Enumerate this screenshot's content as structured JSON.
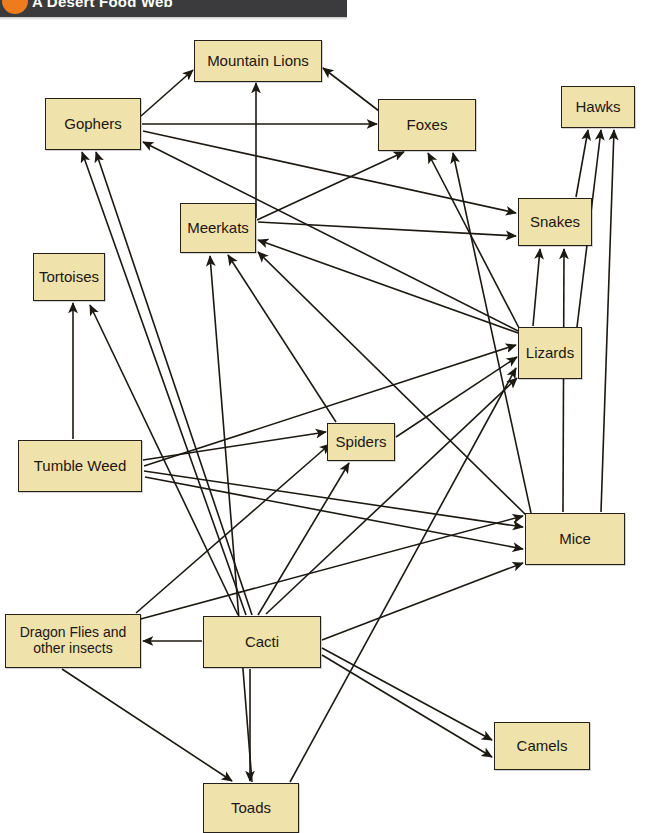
{
  "banner": {
    "title": "A Desert Food Web",
    "dot_icon": "orange-circle-icon",
    "bar_color": "#3b3b3d",
    "accent_color": "#ef7b1f"
  },
  "diagram": {
    "type": "food-web",
    "node_fill": "#f0e2ab",
    "node_border": "#26201a",
    "edge_color": "#1c1812",
    "nodes": [
      {
        "id": "mountain_lions",
        "label": "Mountain Lions",
        "x": 194,
        "y": 40,
        "w": 128,
        "h": 42,
        "trophic": "tertiary-consumer"
      },
      {
        "id": "gophers",
        "label": "Gophers",
        "x": 45,
        "y": 98,
        "w": 96,
        "h": 52,
        "trophic": "primary-consumer"
      },
      {
        "id": "foxes",
        "label": "Foxes",
        "x": 378,
        "y": 99,
        "w": 98,
        "h": 52,
        "trophic": "secondary-consumer"
      },
      {
        "id": "hawks",
        "label": "Hawks",
        "x": 561,
        "y": 86,
        "w": 74,
        "h": 42,
        "trophic": "tertiary-consumer"
      },
      {
        "id": "snakes",
        "label": "Snakes",
        "x": 518,
        "y": 198,
        "w": 74,
        "h": 48,
        "trophic": "secondary-consumer"
      },
      {
        "id": "meerkats",
        "label": "Meerkats",
        "x": 180,
        "y": 203,
        "w": 76,
        "h": 50,
        "trophic": "secondary-consumer"
      },
      {
        "id": "tortoises",
        "label": "Tortoises",
        "x": 33,
        "y": 253,
        "w": 72,
        "h": 48,
        "trophic": "primary-consumer"
      },
      {
        "id": "lizards",
        "label": "Lizards",
        "x": 518,
        "y": 327,
        "w": 64,
        "h": 52,
        "trophic": "secondary-consumer"
      },
      {
        "id": "spiders",
        "label": "Spiders",
        "x": 327,
        "y": 423,
        "w": 68,
        "h": 38,
        "trophic": "secondary-consumer"
      },
      {
        "id": "tumble_weed",
        "label": "Tumble Weed",
        "x": 18,
        "y": 440,
        "w": 124,
        "h": 52,
        "trophic": "producer"
      },
      {
        "id": "mice",
        "label": "Mice",
        "x": 525,
        "y": 513,
        "w": 100,
        "h": 52,
        "trophic": "primary-consumer"
      },
      {
        "id": "dragon_flies",
        "label": "Dragon Flies and other insects",
        "x": 5,
        "y": 614,
        "w": 136,
        "h": 54,
        "trophic": "primary-consumer"
      },
      {
        "id": "cacti",
        "label": "Cacti",
        "x": 203,
        "y": 616,
        "w": 118,
        "h": 52,
        "trophic": "producer"
      },
      {
        "id": "camels",
        "label": "Camels",
        "x": 494,
        "y": 722,
        "w": 96,
        "h": 48,
        "trophic": "primary-consumer"
      },
      {
        "id": "toads",
        "label": "Toads",
        "x": 203,
        "y": 783,
        "w": 96,
        "h": 50,
        "trophic": "secondary-consumer"
      }
    ],
    "edges": [
      {
        "from": "gophers",
        "to": "mountain_lions",
        "x1": 141,
        "y1": 116,
        "x2": 193,
        "y2": 70
      },
      {
        "from": "meerkats",
        "to": "mountain_lions",
        "x1": 256,
        "y1": 218,
        "x2": 256,
        "y2": 83
      },
      {
        "from": "foxes",
        "to": "mountain_lions",
        "x1": 379,
        "y1": 111,
        "x2": 323,
        "y2": 68
      },
      {
        "from": "gophers",
        "to": "foxes",
        "x1": 142,
        "y1": 124,
        "x2": 377,
        "y2": 124
      },
      {
        "from": "meerkats",
        "to": "foxes",
        "x1": 257,
        "y1": 220,
        "x2": 404,
        "y2": 152
      },
      {
        "from": "lizards",
        "to": "foxes",
        "x1": 519,
        "y1": 328,
        "x2": 428,
        "y2": 153
      },
      {
        "from": "mice",
        "to": "foxes",
        "x1": 531,
        "y1": 513,
        "x2": 453,
        "y2": 153
      },
      {
        "from": "gophers",
        "to": "snakes",
        "x1": 143,
        "y1": 131,
        "x2": 516,
        "y2": 213
      },
      {
        "from": "meerkats",
        "to": "snakes",
        "x1": 258,
        "y1": 222,
        "x2": 516,
        "y2": 236
      },
      {
        "from": "lizards",
        "to": "snakes",
        "x1": 533,
        "y1": 326,
        "x2": 540,
        "y2": 249
      },
      {
        "from": "mice",
        "to": "snakes",
        "x1": 563,
        "y1": 512,
        "x2": 564,
        "y2": 249
      },
      {
        "from": "snakes",
        "to": "hawks",
        "x1": 576,
        "y1": 197,
        "x2": 588,
        "y2": 130
      },
      {
        "from": "lizards",
        "to": "hawks",
        "x1": 577,
        "y1": 327,
        "x2": 601,
        "y2": 130
      },
      {
        "from": "mice",
        "to": "hawks",
        "x1": 601,
        "y1": 512,
        "x2": 614,
        "y2": 130
      },
      {
        "from": "lizards",
        "to": "gophers",
        "x1": 518,
        "y1": 331,
        "x2": 143,
        "y2": 142
      },
      {
        "from": "lizards",
        "to": "meerkats",
        "x1": 518,
        "y1": 333,
        "x2": 258,
        "y2": 240
      },
      {
        "from": "mice",
        "to": "meerkats",
        "x1": 526,
        "y1": 515,
        "x2": 258,
        "y2": 252
      },
      {
        "from": "spiders",
        "to": "meerkats",
        "x1": 336,
        "y1": 422,
        "x2": 228,
        "y2": 255
      },
      {
        "from": "toads",
        "to": "meerkats",
        "x1": 252,
        "y1": 782,
        "x2": 210,
        "y2": 256
      },
      {
        "from": "cacti",
        "to": "gophers",
        "x1": 246,
        "y1": 615,
        "x2": 82,
        "y2": 152
      },
      {
        "from": "cacti",
        "to": "gophers",
        "x1": 252,
        "y1": 615,
        "x2": 96,
        "y2": 152
      },
      {
        "from": "tumble_weed",
        "to": "tortoises",
        "x1": 73,
        "y1": 439,
        "x2": 73,
        "y2": 303
      },
      {
        "from": "cacti",
        "to": "tortoises",
        "x1": 238,
        "y1": 615,
        "x2": 90,
        "y2": 305
      },
      {
        "from": "cacti",
        "to": "spiders",
        "x1": 258,
        "y1": 615,
        "x2": 349,
        "y2": 463
      },
      {
        "from": "tumble_weed",
        "to": "spiders",
        "x1": 143,
        "y1": 460,
        "x2": 326,
        "y2": 432
      },
      {
        "from": "dragon_flies",
        "to": "spiders",
        "x1": 136,
        "y1": 613,
        "x2": 330,
        "y2": 444
      },
      {
        "from": "cacti",
        "to": "lizards",
        "x1": 266,
        "y1": 614,
        "x2": 517,
        "y2": 378
      },
      {
        "from": "spiders",
        "to": "lizards",
        "x1": 396,
        "y1": 437,
        "x2": 517,
        "y2": 357
      },
      {
        "from": "tumble_weed",
        "to": "lizards",
        "x1": 144,
        "y1": 466,
        "x2": 516,
        "y2": 345
      },
      {
        "from": "toads",
        "to": "lizards",
        "x1": 290,
        "y1": 782,
        "x2": 516,
        "y2": 368
      },
      {
        "from": "cacti",
        "to": "mice",
        "x1": 322,
        "y1": 640,
        "x2": 523,
        "y2": 563
      },
      {
        "from": "tumble_weed",
        "to": "mice",
        "x1": 144,
        "y1": 471,
        "x2": 523,
        "y2": 527
      },
      {
        "from": "tumble_weed",
        "to": "mice",
        "x1": 145,
        "y1": 477,
        "x2": 523,
        "y2": 549
      },
      {
        "from": "dragon_flies",
        "to": "mice",
        "x1": 137,
        "y1": 620,
        "x2": 523,
        "y2": 516
      },
      {
        "from": "cacti",
        "to": "dragon_flies",
        "x1": 202,
        "y1": 641,
        "x2": 143,
        "y2": 641
      },
      {
        "from": "cacti",
        "to": "camels",
        "x1": 322,
        "y1": 648,
        "x2": 492,
        "y2": 740
      },
      {
        "from": "cacti",
        "to": "camels",
        "x1": 322,
        "y1": 655,
        "x2": 492,
        "y2": 757
      },
      {
        "from": "cacti",
        "to": "toads",
        "x1": 250,
        "y1": 669,
        "x2": 250,
        "y2": 781
      },
      {
        "from": "dragon_flies",
        "to": "toads",
        "x1": 62,
        "y1": 669,
        "x2": 232,
        "y2": 781
      }
    ]
  }
}
